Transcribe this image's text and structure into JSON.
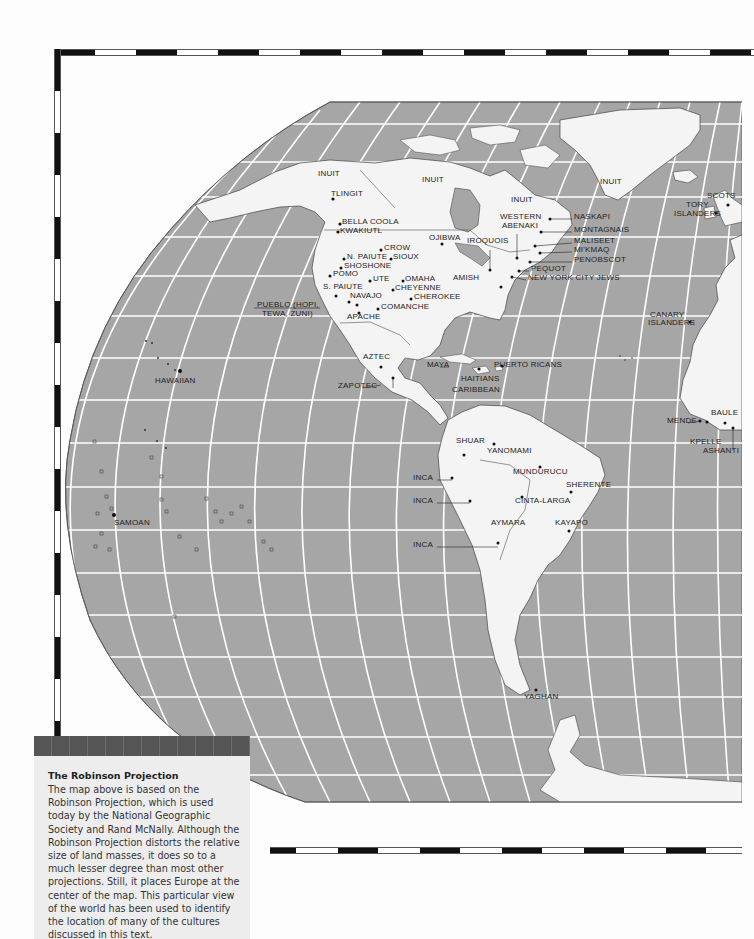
{
  "map": {
    "projection": "Robinson Projection",
    "colors": {
      "ocean": "#a6a6a6",
      "land": "#f4f4f4",
      "graticule": "#ffffff",
      "outline": "#555555",
      "label": "#222222",
      "panel_bg": "#ededed",
      "panel_band": "#555555"
    },
    "labels": {
      "north_america": [
        {
          "id": "inuit-1",
          "text": "INUIT",
          "x": 318,
          "y": 173
        },
        {
          "id": "inuit-2",
          "text": "INUIT",
          "x": 422,
          "y": 179
        },
        {
          "id": "inuit-3",
          "text": "INUIT",
          "x": 511,
          "y": 199
        },
        {
          "id": "inuit-4",
          "text": "INUIT",
          "x": 600,
          "y": 181
        },
        {
          "id": "tlingit",
          "text": "TLINGIT",
          "x": 331,
          "y": 193
        },
        {
          "id": "bella-coola",
          "text": "BELLA COOLA",
          "x": 342,
          "y": 221
        },
        {
          "id": "kwakiutl",
          "text": "KWAKIUTL",
          "x": 340,
          "y": 230
        },
        {
          "id": "ojibwa",
          "text": "OJIBWA",
          "x": 429,
          "y": 237
        },
        {
          "id": "iroquois",
          "text": "IROQUOIS",
          "x": 467,
          "y": 240
        },
        {
          "id": "western-abenaki-1",
          "text": "WESTERN",
          "x": 500,
          "y": 216
        },
        {
          "id": "western-abenaki-2",
          "text": "ABENAKI",
          "x": 502,
          "y": 225
        },
        {
          "id": "crow",
          "text": "CROW",
          "x": 384,
          "y": 247
        },
        {
          "id": "n-paiute",
          "text": "N. PAIUTE",
          "x": 347,
          "y": 256
        },
        {
          "id": "sioux",
          "text": "SIOUX",
          "x": 393,
          "y": 256
        },
        {
          "id": "shoshone",
          "text": "SHOSHONE",
          "x": 344,
          "y": 265
        },
        {
          "id": "pomo",
          "text": "POMO",
          "x": 333,
          "y": 273
        },
        {
          "id": "ute",
          "text": "UTE",
          "x": 373,
          "y": 278
        },
        {
          "id": "omaha",
          "text": "OMAHA",
          "x": 405,
          "y": 278
        },
        {
          "id": "amish",
          "text": "AMISH",
          "x": 453,
          "y": 277
        },
        {
          "id": "s-paiute",
          "text": "S. PAIUTE",
          "x": 323,
          "y": 286
        },
        {
          "id": "cheyenne",
          "text": "CHEYENNE",
          "x": 395,
          "y": 287
        },
        {
          "id": "navajo",
          "text": "NAVAJO",
          "x": 350,
          "y": 295
        },
        {
          "id": "cherokee",
          "text": "CHEROKEE",
          "x": 414,
          "y": 296
        },
        {
          "id": "pueblo-1",
          "text": "PUEBLO (HOPI,",
          "x": 257,
          "y": 304
        },
        {
          "id": "pueblo-2",
          "text": "TEWA, ZUNI)",
          "x": 262,
          "y": 313
        },
        {
          "id": "comanche",
          "text": "COMANCHE",
          "x": 381,
          "y": 306
        },
        {
          "id": "apache",
          "text": "APACHE",
          "x": 347,
          "y": 316
        },
        {
          "id": "naskapi",
          "text": "NASKAPI",
          "x": 574,
          "y": 216
        },
        {
          "id": "montagnais",
          "text": "MONTAGNAIS",
          "x": 574,
          "y": 229
        },
        {
          "id": "maliseet",
          "text": "MALISEET",
          "x": 574,
          "y": 240
        },
        {
          "id": "mikmaq",
          "text": "MI'KMAQ",
          "x": 574,
          "y": 249
        },
        {
          "id": "penobscot",
          "text": "PENOBSCOT",
          "x": 574,
          "y": 259
        },
        {
          "id": "pequot",
          "text": "PEQUOT",
          "x": 531,
          "y": 268
        },
        {
          "id": "nyc-jews",
          "text": "NEW YORK CITY JEWS",
          "x": 528,
          "y": 277
        }
      ],
      "central_america_caribbean": [
        {
          "id": "aztec",
          "text": "AZTEC",
          "x": 363,
          "y": 356
        },
        {
          "id": "zapotec",
          "text": "ZAPOTEC",
          "x": 338,
          "y": 385
        },
        {
          "id": "maya",
          "text": "MAYA",
          "x": 427,
          "y": 364
        },
        {
          "id": "puerto-ricans",
          "text": "PUERTO RICANS",
          "x": 494,
          "y": 364
        },
        {
          "id": "haitians",
          "text": "HAITIANS",
          "x": 461,
          "y": 378
        },
        {
          "id": "caribbean",
          "text": "CARIBBEAN",
          "x": 452,
          "y": 389
        }
      ],
      "south_america": [
        {
          "id": "shuar",
          "text": "SHUAR",
          "x": 456,
          "y": 440
        },
        {
          "id": "yanomami",
          "text": "YANOMAMI",
          "x": 487,
          "y": 450
        },
        {
          "id": "inca-1",
          "text": "INCA",
          "x": 413,
          "y": 477
        },
        {
          "id": "mundurucu",
          "text": "MUNDURUCU",
          "x": 513,
          "y": 471
        },
        {
          "id": "sherente",
          "text": "SHERENTE",
          "x": 566,
          "y": 484
        },
        {
          "id": "inca-2",
          "text": "INCA",
          "x": 413,
          "y": 500
        },
        {
          "id": "cinta-larga",
          "text": "CINTA-LARGA",
          "x": 515,
          "y": 500
        },
        {
          "id": "aymara",
          "text": "AYMARA",
          "x": 491,
          "y": 522
        },
        {
          "id": "kayapo",
          "text": "KAYAPO",
          "x": 555,
          "y": 522
        },
        {
          "id": "inca-3",
          "text": "INCA",
          "x": 413,
          "y": 544
        },
        {
          "id": "yaghan",
          "text": "YAGHAN",
          "x": 524,
          "y": 696
        }
      ],
      "pacific": [
        {
          "id": "hawaiian",
          "text": "HAWAIIAN",
          "x": 155,
          "y": 380
        },
        {
          "id": "samoan",
          "text": "SAMOAN",
          "x": 114,
          "y": 522
        }
      ],
      "europe_africa": [
        {
          "id": "scots",
          "text": "SCOTS",
          "x": 707,
          "y": 195
        },
        {
          "id": "tory-islanders-1",
          "text": "TORY",
          "x": 686,
          "y": 204
        },
        {
          "id": "tory-islanders-2",
          "text": "ISLANDERS",
          "x": 674,
          "y": 213
        },
        {
          "id": "canary-islanders-1",
          "text": "CANARY",
          "x": 650,
          "y": 314
        },
        {
          "id": "canary-islanders-2",
          "text": "ISLANDERS",
          "x": 648,
          "y": 322
        },
        {
          "id": "baule",
          "text": "BAULE",
          "x": 711,
          "y": 412
        },
        {
          "id": "mende",
          "text": "MENDE",
          "x": 667,
          "y": 420
        },
        {
          "id": "kpelle",
          "text": "KPELLE",
          "x": 690,
          "y": 441
        },
        {
          "id": "ashanti",
          "text": "ASHANTI",
          "x": 703,
          "y": 450
        }
      ]
    }
  },
  "info_panel": {
    "title": "The Robinson Projection",
    "body": "The map above is based on the Robinson Projection, which is used today by the National Geographic Society and Rand McNally. Although the Robinson Projection distorts the relative size of land masses, it does so to a much lesser degree than most other projections. Still, it places Europe at the center of the map. This particular view of the world has been used to identify the location of many of the cultures discussed in this text."
  }
}
